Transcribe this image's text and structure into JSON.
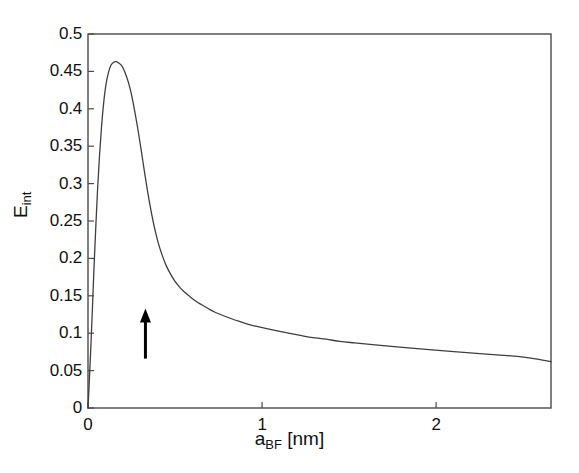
{
  "chart_data": {
    "type": "line",
    "title": "",
    "subtitle": "",
    "xlabel": "a_BF [nm]",
    "xlabel_base": "a",
    "xlabel_sub": "BF",
    "xlabel_unit": " [nm]",
    "ylabel": "E_int",
    "ylabel_base": "E",
    "ylabel_sub": "int",
    "xlim": [
      0,
      2.66
    ],
    "ylim": [
      0,
      0.5
    ],
    "grid": false,
    "legend": null,
    "xticks": [
      0,
      1,
      2
    ],
    "xtick_labels": [
      "0",
      "1",
      "2"
    ],
    "yticks": [
      0,
      0.05,
      0.1,
      0.15,
      0.2,
      0.25,
      0.3,
      0.35,
      0.4,
      0.45,
      0.5
    ],
    "ytick_labels": [
      "0",
      "0.05",
      "0.1",
      "0.15",
      "0.2",
      "0.25",
      "0.3",
      "0.35",
      "0.4",
      "0.45",
      "0.5"
    ],
    "line_color": "#3f3f3f",
    "line_width": 1.3,
    "axes_color": "#4a4a4a",
    "background": "#ffffff",
    "peak": {
      "x": 0.195,
      "y": 0.463
    },
    "annotations": [
      {
        "type": "arrow",
        "name": "up-arrow-marker",
        "x": 0.33,
        "y_tail": 0.066,
        "y_head": 0.121,
        "color": "#000000"
      }
    ],
    "series": [
      {
        "name": "E_int",
        "x": [
          0.0,
          0.008,
          0.017,
          0.026,
          0.035,
          0.045,
          0.055,
          0.066,
          0.078,
          0.09,
          0.103,
          0.117,
          0.131,
          0.146,
          0.162,
          0.178,
          0.195,
          0.212,
          0.23,
          0.248,
          0.266,
          0.285,
          0.304,
          0.323,
          0.342,
          0.362,
          0.382,
          0.403,
          0.425,
          0.448,
          0.472,
          0.498,
          0.525,
          0.554,
          0.585,
          0.618,
          0.653,
          0.69,
          0.73,
          0.772,
          0.817,
          0.865,
          0.916,
          0.97,
          1.027,
          1.088,
          1.152,
          1.22,
          1.292,
          1.368,
          1.448,
          1.532,
          1.62,
          1.712,
          1.808,
          1.908,
          2.012,
          2.12,
          2.232,
          2.348,
          2.468,
          2.56,
          2.66
        ],
        "y": [
          0.0,
          0.038,
          0.085,
          0.137,
          0.19,
          0.243,
          0.292,
          0.337,
          0.377,
          0.408,
          0.432,
          0.448,
          0.458,
          0.462,
          0.463,
          0.461,
          0.457,
          0.449,
          0.437,
          0.421,
          0.4,
          0.375,
          0.347,
          0.318,
          0.29,
          0.264,
          0.241,
          0.221,
          0.205,
          0.191,
          0.18,
          0.17,
          0.162,
          0.155,
          0.149,
          0.143,
          0.138,
          0.133,
          0.128,
          0.124,
          0.12,
          0.116,
          0.112,
          0.109,
          0.106,
          0.103,
          0.1,
          0.097,
          0.094,
          0.092,
          0.089,
          0.087,
          0.085,
          0.083,
          0.081,
          0.079,
          0.077,
          0.075,
          0.073,
          0.071,
          0.069,
          0.066,
          0.062
        ]
      }
    ]
  }
}
